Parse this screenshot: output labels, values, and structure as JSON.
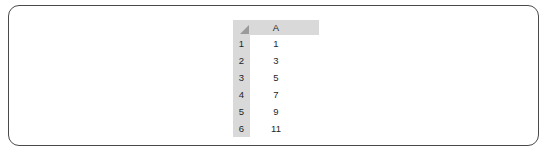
{
  "container": {
    "name": "rounded-panel",
    "border_color": "#4a4a4a",
    "background": "#ffffff"
  },
  "spreadsheet": {
    "select_all_icon": "select-all-triangle",
    "header_background": "#d9d9d9",
    "gridline_color": "#e2e2e2",
    "column_headers": [
      "A"
    ],
    "row_headers": [
      "1",
      "2",
      "3",
      "4",
      "5",
      "6"
    ],
    "rows": [
      {
        "row_label": "1",
        "A": "1"
      },
      {
        "row_label": "2",
        "A": "3"
      },
      {
        "row_label": "3",
        "A": "5"
      },
      {
        "row_label": "4",
        "A": "7"
      },
      {
        "row_label": "5",
        "A": "9"
      },
      {
        "row_label": "6",
        "A": "11"
      }
    ]
  }
}
